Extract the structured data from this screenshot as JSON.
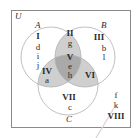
{
  "universe": {
    "label": "U"
  },
  "sets": [
    {
      "name": "A",
      "label": "A",
      "cx": 51,
      "cy": 57,
      "r": 30
    },
    {
      "name": "B",
      "label": "B",
      "cx": 85,
      "cy": 57,
      "r": 30
    },
    {
      "name": "C",
      "label": "C",
      "cx": 68,
      "cy": 85,
      "r": 30
    }
  ],
  "colors": {
    "border": "#8a8a8a",
    "circle_stroke": "#b0b0b0",
    "two_overlap": "#cfcfcf",
    "triple_overlap": "#a9a9a9",
    "text": "#2a2a2a"
  },
  "regions": {
    "I": {
      "roman": "I",
      "elements": [
        "d",
        "i",
        "j"
      ]
    },
    "II": {
      "roman": "II",
      "elements": [
        "g"
      ]
    },
    "III": {
      "roman": "III",
      "elements": [
        "b",
        "l"
      ]
    },
    "IV": {
      "roman": "IV",
      "elements": [
        "a"
      ]
    },
    "V": {
      "roman": "V",
      "elements": [
        "e",
        "h"
      ]
    },
    "VI": {
      "roman": "VI",
      "elements": []
    },
    "VII": {
      "roman": "VII",
      "elements": [
        "c"
      ]
    },
    "VIII": {
      "roman": "VIII",
      "elements": [
        "f",
        "k"
      ]
    }
  }
}
